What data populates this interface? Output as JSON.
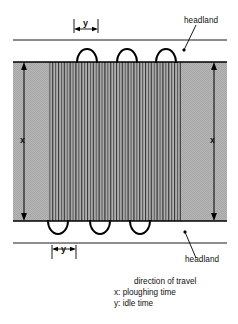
{
  "figure": {
    "type": "schematic-diagram",
    "labels": {
      "headland_top": "headland",
      "headland_bottom": "headland",
      "dim_x_left": "x",
      "dim_x_right": "x",
      "dim_y_top": "y",
      "dim_y_bottom": "y"
    },
    "legend": {
      "arrow_label": "direction of travel",
      "key_x": "x: ploughing time",
      "key_y": "y: idle time"
    },
    "colors": {
      "field_fill": "#b4b4b4",
      "furrow_line": "#4a4a4a",
      "stroke": "#000000",
      "background": "#ffffff"
    },
    "geometry": {
      "field_left": 13,
      "field_right": 227,
      "field_top": 62,
      "field_bottom": 221,
      "headland_line_top_y": 40,
      "headland_line_bottom_y": 243,
      "hatch_left": 48,
      "hatch_right": 181,
      "furrow_count": 46,
      "turn_loops_top": 3,
      "turn_loops_bottom": 3
    }
  }
}
